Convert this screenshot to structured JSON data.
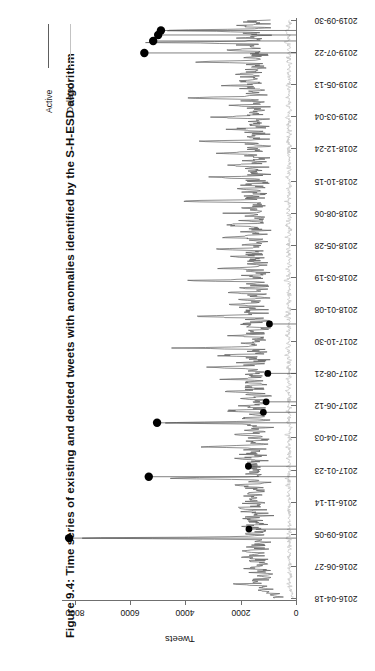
{
  "figure": {
    "title": "Figure 9.4: Time series of existing and deleted tweets with anomalies identified by the S-H-ESD algorithm",
    "axis_title": "Tweets"
  },
  "legend": {
    "items": [
      {
        "label": "Active",
        "color": "#5e5e5e"
      },
      {
        "label": "Deleted",
        "color": "#c3c3c3"
      }
    ]
  },
  "chart_data": {
    "type": "line",
    "title": "Figure 9.4: Time series of existing and deleted tweets with anomalies identified by the S-H-ESD algorithm",
    "xlabel": "",
    "ylabel": "Tweets",
    "ylim": [
      0,
      8600
    ],
    "grid": false,
    "legend_position": "top-left",
    "orientation": "rotated-90-ccw",
    "y_ticks": [
      0,
      2000,
      4000,
      6000,
      8000
    ],
    "x_ticks": [
      "2016-04-18",
      "2016-06-27",
      "2016-09-05",
      "2016-11-14",
      "2017-01-23",
      "2017-04-03",
      "2017-06-12",
      "2017-08-21",
      "2017-10-30",
      "2018-01-08",
      "2018-03-19",
      "2018-05-28",
      "2018-08-06",
      "2018-10-15",
      "2018-12-24",
      "2019-03-04",
      "2019-05-13",
      "2019-07-22",
      "2019-09-30"
    ],
    "series": [
      {
        "name": "Active",
        "color": "#5e5e5e",
        "values": [
          640,
          700,
          820,
          760,
          900,
          1150,
          980,
          1400,
          1080,
          2250,
          1250,
          1500,
          1180,
          1330,
          1020,
          1180,
          940,
          1420,
          1100,
          1260,
          1600,
          1180,
          1340,
          980,
          1220,
          1520,
          1150,
          1680,
          1240,
          1400,
          1120,
          1980,
          1300,
          1150,
          1540,
          1260,
          1380,
          1080,
          1600,
          1280,
          8200,
          1540,
          1260,
          1800,
          1340,
          1120,
          1460,
          1220,
          1620,
          1300,
          1180,
          1520,
          1260,
          1740,
          1380,
          1160,
          1480,
          1240,
          1660,
          1340,
          2140,
          1420,
          1200,
          1560,
          1300,
          1760,
          1380,
          1180,
          1520,
          1280,
          1680,
          1360,
          1220,
          1580,
          1320,
          2420,
          1440,
          1240,
          1620,
          1340,
          5320,
          1460,
          1260,
          1700,
          1380,
          1180,
          1540,
          1300,
          1840,
          1400,
          1220,
          1600,
          1340,
          2060,
          1420,
          1240,
          1680,
          1360,
          1200,
          1560,
          1320,
          3180,
          1440,
          1260,
          1720,
          1380,
          1180,
          1580,
          1340,
          2260,
          1420,
          1240,
          1660,
          1360,
          1200,
          1540,
          1300,
          5020,
          1440,
          1260,
          1700,
          1380,
          1180,
          1580,
          1320,
          2640,
          1460,
          1240,
          1680,
          1360,
          1200,
          1540,
          1300,
          1860,
          1420,
          1240,
          1640,
          1340,
          2980,
          1460,
          1260,
          1720,
          1380,
          1180,
          1560,
          1320,
          2180,
          1440,
          1240,
          1660,
          1360,
          1200,
          1540,
          1300,
          3420,
          1460,
          1260,
          1700,
          1380,
          1180,
          1580,
          1320,
          2760,
          1440,
          1240,
          1680,
          1360,
          4480,
          1540,
          1300,
          1880,
          1420,
          1240,
          1640,
          1340,
          2380,
          1460,
          1260,
          1720,
          1380,
          1180,
          1560,
          1320,
          2080,
          1440,
          1240,
          1660,
          1360,
          3820,
          1540,
          1300,
          1900,
          1420,
          1240,
          1640,
          1340,
          2480,
          1460,
          1260,
          1740,
          1380,
          1180,
          1580,
          1320,
          2240,
          1440,
          1240,
          1680,
          1360,
          1200,
          1540,
          1300,
          4120,
          1460,
          1260,
          1720,
          1380,
          1180,
          1600,
          1340,
          2680,
          1460,
          1260,
          1700,
          1380,
          1200,
          1560,
          1320,
          2120,
          1440,
          1240,
          1660,
          1360,
          3280,
          1500,
          1280,
          1820,
          1400,
          1220,
          1620,
          1340,
          2540,
          1460,
          1260,
          1720,
          1380,
          1180,
          1580,
          1320,
          2860,
          1480,
          1260,
          1740,
          1380,
          1200,
          1560,
          1320,
          2260,
          1440,
          1240,
          1680,
          1360,
          1200,
          1540,
          1300,
          4680,
          1500,
          1280,
          1780,
          1400,
          1220,
          1620,
          1340,
          2420,
          1460,
          1260,
          1700,
          1380,
          1180,
          1580,
          1320,
          3060,
          1480,
          1260,
          1720,
          1380,
          1200,
          1560,
          1320,
          2180,
          1440,
          1240,
          1660,
          1360,
          1200,
          1540,
          1300,
          2720,
          1460,
          1260,
          1700,
          1380,
          1180,
          1580,
          1320,
          3520,
          1500,
          1280,
          1800,
          1400,
          1220,
          1620,
          1340,
          2320,
          1460,
          1260,
          1720,
          1380,
          1180,
          1560,
          1320,
          2940,
          1480,
          1260,
          1740,
          1380,
          1200,
          1560,
          1320,
          2080,
          1440,
          1240,
          1680,
          1360,
          4260,
          1520,
          1300,
          1860,
          1420,
          1240,
          1640,
          1340,
          2600,
          1460,
          1260,
          1700,
          1380,
          1180,
          1580,
          1320,
          2180,
          1440,
          1240,
          1660,
          1360,
          1200,
          1540,
          1300,
          3720,
          1500,
          1280,
          1820,
          1400,
          1220,
          1620,
          1340,
          2440,
          1460,
          1260,
          1720,
          1380,
          5480,
          1600,
          1340,
          1960,
          1440,
          1260,
          1680,
          1360,
          5160,
          1580,
          1320,
          1900,
          1420,
          1240,
          1660,
          1350
        ]
      },
      {
        "name": "Deleted",
        "color": "#c3c3c3",
        "values": [
          120,
          140,
          160,
          150,
          175,
          210,
          185,
          240,
          200,
          300,
          225,
          260,
          215,
          235,
          190,
          215,
          175,
          250,
          200,
          225,
          270,
          210,
          235,
          180,
          220,
          260,
          205,
          280,
          215,
          240,
          200,
          310,
          225,
          205,
          260,
          220,
          235,
          195,
          265,
          220,
          330,
          260,
          215,
          290,
          230,
          200,
          250,
          210,
          270,
          225,
          205,
          255,
          215,
          285,
          235,
          200,
          250,
          210,
          275,
          230,
          320,
          240,
          205,
          260,
          220,
          285,
          235,
          200,
          255,
          215,
          275,
          230,
          205,
          260,
          220,
          340,
          245,
          210,
          270,
          230,
          360,
          250,
          215,
          280,
          235,
          200,
          260,
          220,
          300,
          240,
          205,
          265,
          225,
          315,
          240,
          210,
          275,
          230,
          200,
          260,
          220,
          350,
          245,
          215,
          285,
          235,
          200,
          265,
          225,
          325,
          240,
          210,
          275,
          230,
          200,
          260,
          220,
          355,
          245,
          215,
          280,
          235,
          200,
          265,
          225,
          335,
          250,
          210,
          280,
          230,
          200,
          260,
          220,
          305,
          240,
          210,
          270,
          230,
          345,
          250,
          215,
          285,
          235,
          200,
          265,
          225,
          320,
          245,
          210,
          275,
          230,
          200,
          260,
          220,
          355,
          250,
          215,
          280,
          235,
          200,
          265,
          225,
          340,
          245,
          210,
          280,
          230,
          375,
          260,
          220,
          310,
          240,
          210,
          270,
          230,
          330,
          250,
          215,
          285,
          235,
          200,
          265,
          225,
          315,
          245,
          210,
          275,
          230,
          365,
          260,
          220,
          315,
          240,
          210,
          270,
          230,
          335,
          250,
          215,
          290,
          235,
          200,
          265,
          225,
          325,
          245,
          210,
          280,
          230,
          200,
          260,
          220,
          370,
          255,
          215,
          285,
          235,
          200,
          270,
          230,
          340,
          250,
          215,
          280,
          235,
          205,
          265,
          225,
          320,
          245,
          210,
          275,
          230,
          350,
          255,
          220,
          305,
          240,
          210,
          270,
          230,
          335,
          250,
          215,
          285,
          235,
          200,
          265,
          225,
          345,
          255,
          215,
          290,
          235,
          205,
          265,
          225,
          325,
          245,
          210,
          280,
          230,
          205,
          260,
          220,
          385,
          255,
          220,
          300,
          240,
          210,
          270,
          230,
          330,
          250,
          215,
          280,
          235,
          200,
          265,
          225,
          350,
          255,
          215,
          285,
          235,
          205,
          265,
          225,
          320,
          245,
          210,
          275,
          230,
          205,
          260,
          220,
          340,
          250,
          215,
          285,
          235,
          200,
          265,
          225,
          360,
          255,
          220,
          300,
          240,
          210,
          270,
          230,
          330,
          250,
          215,
          285,
          235,
          200,
          265,
          225,
          345,
          255,
          215,
          290,
          235,
          205,
          265,
          225,
          315,
          245,
          210,
          280,
          230,
          375,
          260,
          220,
          310,
          240,
          210,
          270,
          230,
          335,
          250,
          215,
          280,
          235,
          200,
          265,
          225,
          320,
          245,
          210,
          275,
          230,
          205,
          260,
          220,
          365,
          255,
          220,
          305,
          240,
          210,
          270,
          230,
          340,
          250,
          215,
          285,
          235,
          390,
          270,
          225,
          320,
          245,
          215,
          280,
          230,
          380,
          265,
          225,
          315,
          240,
          210,
          275,
          230
        ]
      }
    ],
    "anomalies": {
      "marker": "filled-circle",
      "color": "#000000",
      "points": [
        {
          "x": "2016-06-27",
          "index": 40,
          "y": 8200
        },
        {
          "x": "2016-06-27",
          "index": 46,
          "y": 1700
        },
        {
          "x": "2016-11-14",
          "index": 81,
          "y": 5320
        },
        {
          "x": "2016-11-14",
          "index": 88,
          "y": 1720
        },
        {
          "x": "2017-04-03",
          "index": 117,
          "y": 5020
        },
        {
          "x": "2017-04-03",
          "index": 124,
          "y": 1180
        },
        {
          "x": "2017-04-03",
          "index": 131,
          "y": 1080
        },
        {
          "x": "2017-06-12",
          "index": 150,
          "y": 1020
        },
        {
          "x": "2017-10-30",
          "index": 183,
          "y": 960
        },
        {
          "x": "2019-09-30",
          "index": 364,
          "y": 5480
        },
        {
          "x": "2019-09-30",
          "index": 372,
          "y": 5160
        },
        {
          "x": "2019-09-30",
          "index": 376,
          "y": 4980
        },
        {
          "x": "2019-09-30",
          "index": 379,
          "y": 4880
        }
      ]
    }
  }
}
